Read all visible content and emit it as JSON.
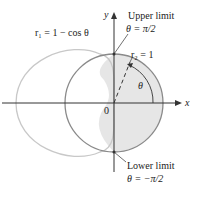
{
  "labels": {
    "r1": "r₁ = 1 − cos θ",
    "r2": "r₂ = 1",
    "upper_title": "Upper limit",
    "upper_eq": "θ = π/2",
    "lower_title": "Lower limit",
    "lower_eq": "θ = −π/2",
    "x_axis": "x",
    "y_axis": "y",
    "origin": "0",
    "theta": "θ"
  },
  "colors": {
    "cardioid": "#c8c8c8",
    "circle": "#8a8a8a",
    "shade": "#e6e6e6",
    "axis": "#333333"
  }
}
